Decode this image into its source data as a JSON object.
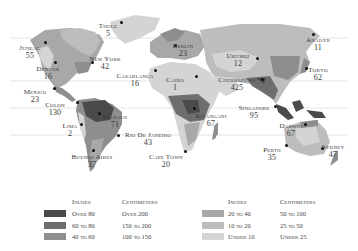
{
  "colors": {
    "over_80": "#4a4a4a",
    "60_to_80": "#6e6e6e",
    "40_to_60": "#8e8e8e",
    "20_to_40": "#a8a8a8",
    "10_to_20": "#bdbdbd",
    "under_10": "#d4d4d4",
    "ocean": "#ffffff",
    "latitude_line": "#d9d9d9"
  },
  "cities": [
    {
      "name": "Thule",
      "value": "5",
      "x": 108,
      "y": 22,
      "dot": [
        121,
        22
      ]
    },
    {
      "name": "Juneau",
      "value": "55",
      "x": 30,
      "y": 44,
      "dot": [
        45,
        42
      ]
    },
    {
      "name": "New York",
      "value": "42",
      "x": 105,
      "y": 55,
      "dot": [
        92,
        62
      ]
    },
    {
      "name": "Denver",
      "value": "16",
      "x": 48,
      "y": 65,
      "dot": [
        55,
        62
      ]
    },
    {
      "name": "Casablanca",
      "value": "16",
      "x": 135,
      "y": 72,
      "dot": [
        155,
        70
      ]
    },
    {
      "name": "Mexico",
      "value": "23",
      "x": 35,
      "y": 88,
      "dot": [
        54,
        88
      ]
    },
    {
      "name": "Berlin",
      "value": "23",
      "x": 183,
      "y": 42,
      "dot": [
        175,
        45
      ]
    },
    {
      "name": "Cairo",
      "value": "1",
      "x": 175,
      "y": 76,
      "dot": [
        196,
        76
      ]
    },
    {
      "name": "Urumqi",
      "value": "12",
      "x": 238,
      "y": 52,
      "dot": [
        257,
        58
      ]
    },
    {
      "name": "Cherrapunji",
      "value": "425",
      "x": 237,
      "y": 76,
      "dot": [
        262,
        79
      ]
    },
    {
      "name": "Anadyr",
      "value": "11",
      "x": 318,
      "y": 36,
      "dot": [
        313,
        34
      ]
    },
    {
      "name": "Tokyo",
      "value": "62",
      "x": 318,
      "y": 66,
      "dot": [
        306,
        68
      ]
    },
    {
      "name": "Colon",
      "value": "130",
      "x": 55,
      "y": 101,
      "dot": [
        77,
        102
      ]
    },
    {
      "name": "Manaus",
      "value": "71",
      "x": 115,
      "y": 113,
      "dot": [
        99,
        113
      ]
    },
    {
      "name": "Lima",
      "value": "2",
      "x": 70,
      "y": 122,
      "dot": [
        81,
        124
      ]
    },
    {
      "name": "Rio de Janeiro",
      "value": "43",
      "x": 148,
      "y": 131,
      "dot": [
        118,
        135
      ]
    },
    {
      "name": "Buenos Aires",
      "value": "37",
      "x": 92,
      "y": 153,
      "dot": [
        93,
        150
      ]
    },
    {
      "name": "Cape Town",
      "value": "20",
      "x": 166,
      "y": 153,
      "dot": [
        185,
        151
      ]
    },
    {
      "name": "Kisangani",
      "value": "67",
      "x": 211,
      "y": 112,
      "dot": [
        194,
        108
      ]
    },
    {
      "name": "Singapore",
      "value": "95",
      "x": 254,
      "y": 104,
      "dot": [
        275,
        106
      ]
    },
    {
      "name": "Darwin",
      "value": "67",
      "x": 291,
      "y": 122,
      "dot": [
        305,
        124
      ]
    },
    {
      "name": "Perth",
      "value": "35",
      "x": 272,
      "y": 146,
      "dot": [
        286,
        145
      ]
    },
    {
      "name": "Sydney",
      "value": "47",
      "x": 333,
      "y": 143,
      "dot": [
        322,
        148
      ]
    }
  ],
  "legend": {
    "left": {
      "inches_header": "Inches",
      "cm_header": "Centimeters",
      "rows": [
        {
          "inches": "Over 80",
          "cm": "Over 200",
          "color": "#4a4a4a"
        },
        {
          "inches": "60 to 80",
          "cm": "150 to 200",
          "color": "#6e6e6e"
        },
        {
          "inches": "40 to 60",
          "cm": "100 to 150",
          "color": "#8e8e8e"
        }
      ]
    },
    "right": {
      "inches_header": "Inches",
      "cm_header": "Centimeters",
      "rows": [
        {
          "inches": "20 to 40",
          "cm": "50 to 100",
          "color": "#a8a8a8"
        },
        {
          "inches": "10 to 20",
          "cm": "25 to 50",
          "color": "#bdbdbd"
        },
        {
          "inches": "Under 10",
          "cm": "Under 25",
          "color": "#d4d4d4"
        }
      ]
    }
  }
}
